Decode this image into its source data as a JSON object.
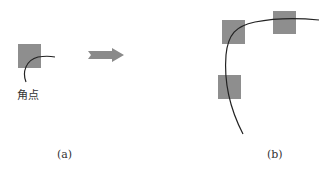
{
  "figure": {
    "panel_a": {
      "caption": "(a)",
      "corner_label": "角点",
      "squares": [
        {
          "x": 18,
          "y": 44,
          "w": 23,
          "h": 24
        }
      ],
      "curve": "M26,82 C22,72 26,60 38,57 C44,56 50,56 55,57"
    },
    "arrow": {
      "x1": 88,
      "y": 55,
      "x2": 124,
      "color": "#8a8a8a"
    },
    "panel_b": {
      "caption": "(b)",
      "squares": [
        {
          "x": 222,
          "y": 20,
          "w": 23,
          "h": 24
        },
        {
          "x": 273,
          "y": 11,
          "w": 23,
          "h": 23
        },
        {
          "x": 218,
          "y": 75,
          "w": 23,
          "h": 24
        }
      ],
      "curve": "M319,20 C300,18 275,18 255,22 C236,26 228,34 226,55 C224,80 228,105 243,134"
    },
    "square_color": "#8e8e8e",
    "curve_color": "#222222"
  }
}
